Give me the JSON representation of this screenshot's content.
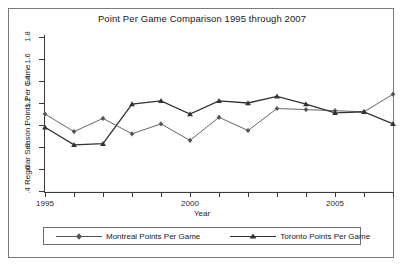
{
  "chart_data": {
    "type": "line",
    "title": "Point Per Game Comparison 1995 through 2007",
    "xlabel": "Year",
    "ylabel": "Regular Season Points Per Game",
    "xlim": [
      1995,
      2007
    ],
    "ylim": [
      0.4,
      1.8
    ],
    "grid": true,
    "legend_position": "bottom",
    "x": [
      1995,
      1996,
      1997,
      1998,
      1999,
      2000,
      2001,
      2002,
      2003,
      2004,
      2005,
      2006,
      2007
    ],
    "x_tick_labels": [
      "1995",
      "2000",
      "2005"
    ],
    "x_tick_values": [
      1995,
      2000,
      2005
    ],
    "y_tick_labels": [
      "1.8",
      "1.6",
      "1.4",
      "1.2",
      "1",
      ".8",
      ".6",
      ".4"
    ],
    "y_tick_values": [
      1.8,
      1.6,
      1.4,
      1.2,
      1.0,
      0.8,
      0.6,
      0.4
    ],
    "series": [
      {
        "name": "Montreal Points Per Game",
        "marker": "diamond",
        "color": "#555555",
        "values": [
          1.1,
          0.94,
          1.06,
          0.92,
          1.01,
          0.86,
          1.07,
          0.95,
          1.15,
          1.14,
          1.13,
          1.12,
          1.28
        ]
      },
      {
        "name": "Toronto Points Per Game",
        "marker": "triangle",
        "color": "#333333",
        "values": [
          0.98,
          0.82,
          0.83,
          1.19,
          1.22,
          1.1,
          1.22,
          1.2,
          1.26,
          1.19,
          1.11,
          1.12,
          1.01
        ]
      }
    ]
  },
  "legend": {
    "items": [
      {
        "label": "Montreal Points Per Game",
        "marker": "diamond-marker-icon"
      },
      {
        "label": "Toronto Points Per Game",
        "marker": "triangle-marker-icon"
      }
    ]
  }
}
